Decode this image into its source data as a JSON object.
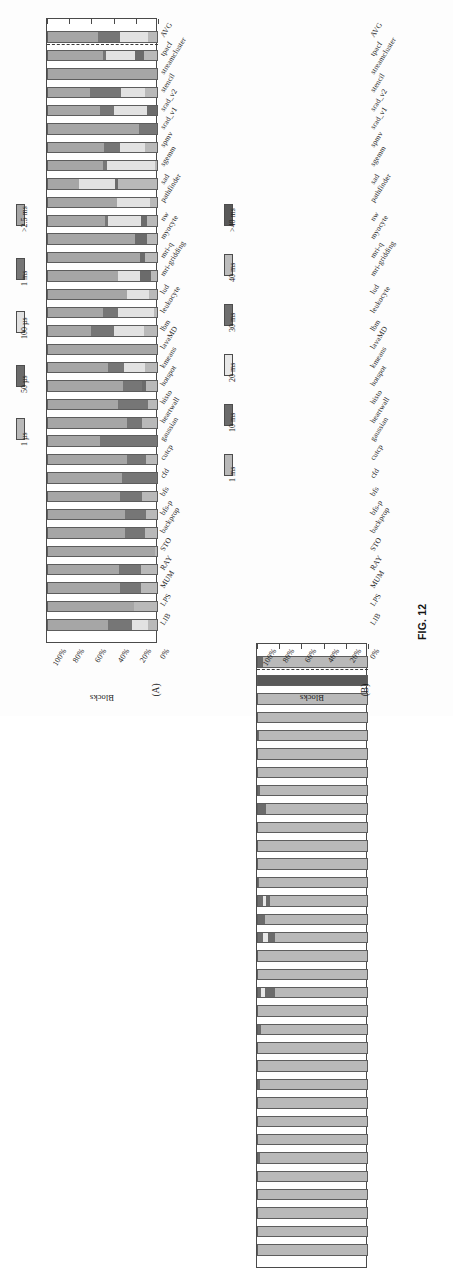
{
  "figure": {
    "caption": "FIG. 12",
    "panel_a_label": "(A)",
    "panel_b_label": "(B)"
  },
  "axis": {
    "y_title": "Blocks",
    "pct_ticks": [
      "100%",
      "80%",
      "60%",
      "40%",
      "20%",
      "0%"
    ]
  },
  "legend_a": {
    "items": [
      {
        "label": "1 µs",
        "color": "#b9b9b9"
      },
      {
        "label": "50 µs",
        "color": "#6b6b6b"
      },
      {
        "label": "100 µs",
        "color": "#e2e2e2"
      },
      {
        "label": "1 ms",
        "color": "#767676"
      },
      {
        "label": ">2.5 ms",
        "color": "#a6a6a6"
      }
    ]
  },
  "legend_b": {
    "items": [
      {
        "label": "1 ms",
        "color": "#b9b9b9"
      },
      {
        "label": "10 ms",
        "color": "#6b6b6b"
      },
      {
        "label": "20 ms",
        "color": "#e8e8e8"
      },
      {
        "label": "30 ms",
        "color": "#6f6f6f"
      },
      {
        "label": "40 ms",
        "color": "#bdbdbd"
      },
      {
        "label": ">40 ms",
        "color": "#595959"
      }
    ]
  },
  "chart_data": [
    {
      "type": "bar",
      "id": "panel-a",
      "title": "(A)",
      "orientation": "horizontal-stacked-100pct",
      "ylabel": "Blocks",
      "xlabel": "",
      "ylim": [
        0,
        100
      ],
      "grid": false,
      "legend_position": "left",
      "stacked_percent": true,
      "separator_after": "AVG",
      "categories": [
        "AVG",
        "tpacf",
        "streamcluster",
        "stencil",
        "srad_v2",
        "srad_v1",
        "spmv",
        "sgemm",
        "sad",
        "pathfinder",
        "nw",
        "myocyte",
        "mri-q",
        "mri-gridding",
        "lud",
        "leukocyte",
        "lbm",
        "lavaMD",
        "kmeans",
        "hotspot",
        "histo",
        "heartwall",
        "gaussian",
        "cutcp",
        "cfd",
        "bfs",
        "bfs-p",
        "backprop",
        "STO",
        "RAY",
        "MUM",
        "LPS",
        "LIB"
      ],
      "series": [
        {
          "name": "1 µs",
          "color": "#b9b9b9",
          "values": [
            9,
            13,
            0,
            12,
            0,
            0,
            12,
            3,
            36,
            7,
            10,
            10,
            12,
            6,
            8,
            4,
            13,
            0,
            12,
            11,
            9,
            14,
            0,
            11,
            0,
            14,
            11,
            12,
            3,
            15,
            15,
            22,
            9
          ]
        },
        {
          "name": "50 µs",
          "color": "#6b6b6b",
          "values": [
            0,
            8,
            0,
            0,
            10,
            0,
            0,
            0,
            3,
            0,
            5,
            11,
            4,
            10,
            0,
            0,
            0,
            0,
            0,
            3,
            0,
            0,
            0,
            0,
            0,
            0,
            0,
            0,
            0,
            0,
            0,
            0,
            0
          ]
        },
        {
          "name": "100 µs",
          "color": "#e2e2e2",
          "values": [
            25,
            26,
            0,
            21,
            30,
            0,
            22,
            43,
            32,
            30,
            30,
            0,
            0,
            20,
            20,
            32,
            27,
            0,
            19,
            0,
            0,
            0,
            0,
            0,
            0,
            0,
            0,
            0,
            0,
            0,
            0,
            0,
            14
          ]
        },
        {
          "name": "1 ms",
          "color": "#767676",
          "values": [
            20,
            3,
            0,
            28,
            12,
            17,
            15,
            4,
            0,
            0,
            3,
            0,
            0,
            0,
            0,
            14,
            20,
            0,
            14,
            18,
            27,
            14,
            52,
            17,
            32,
            20,
            19,
            18,
            0,
            20,
            19,
            0,
            22
          ]
        },
        {
          "name": ">2.5 ms",
          "color": "#a6a6a6",
          "values": [
            46,
            50,
            100,
            39,
            48,
            83,
            51,
            50,
            29,
            63,
            52,
            79,
            84,
            64,
            72,
            50,
            40,
            100,
            55,
            68,
            64,
            72,
            48,
            72,
            68,
            66,
            70,
            70,
            97,
            65,
            66,
            78,
            55
          ]
        }
      ],
      "note": "Values are percent of blocks in each kernel-duration bucket; each bar totals 100%."
    },
    {
      "type": "bar",
      "id": "panel-b",
      "title": "(B)",
      "orientation": "horizontal-stacked-100pct",
      "ylabel": "Blocks",
      "xlabel": "",
      "ylim": [
        0,
        100
      ],
      "grid": false,
      "legend_position": "left",
      "stacked_percent": true,
      "separator_after": "AVG",
      "categories": [
        "AVG",
        "tpacf",
        "streamcluster",
        "stencil",
        "srad_v2",
        "srad_v1",
        "spmv",
        "sgemm",
        "sad",
        "pathfinder",
        "nw",
        "myocyte",
        "mri-q",
        "mri-gridding",
        "lud",
        "leukocyte",
        "lbm",
        "lavaMD",
        "kmeans",
        "hotspot",
        "histo",
        "heartwall",
        "gaussian",
        "cutcp",
        "cfd",
        "bfs",
        "bfs-p",
        "backprop",
        "STO",
        "RAY",
        "MUM",
        "LPS",
        "LIB"
      ],
      "series": [
        {
          "name": "1 ms",
          "color": "#b9b9b9",
          "values": [
            95,
            0,
            100,
            100,
            98,
            100,
            100,
            97,
            92,
            99,
            100,
            100,
            98,
            88,
            93,
            84,
            100,
            100,
            84,
            100,
            96,
            100,
            100,
            97,
            100,
            100,
            100,
            97,
            100,
            100,
            100,
            100,
            100
          ]
        },
        {
          "name": "10 ms",
          "color": "#6b6b6b",
          "values": [
            5,
            0,
            0,
            0,
            2,
            0,
            0,
            3,
            8,
            1,
            0,
            0,
            2,
            4,
            7,
            6,
            0,
            0,
            9,
            0,
            4,
            0,
            0,
            3,
            0,
            0,
            0,
            3,
            0,
            0,
            0,
            0,
            0
          ]
        },
        {
          "name": "20 ms",
          "color": "#e8e8e8",
          "values": [
            0,
            0,
            0,
            0,
            0,
            0,
            0,
            0,
            0,
            0,
            0,
            0,
            0,
            3,
            0,
            5,
            0,
            0,
            3,
            0,
            0,
            0,
            0,
            0,
            0,
            0,
            0,
            0,
            0,
            0,
            0,
            0,
            0
          ]
        },
        {
          "name": "30 ms",
          "color": "#6f6f6f",
          "values": [
            0,
            0,
            0,
            0,
            0,
            0,
            0,
            0,
            0,
            0,
            0,
            0,
            0,
            5,
            0,
            5,
            0,
            0,
            4,
            0,
            0,
            0,
            0,
            0,
            0,
            0,
            0,
            0,
            0,
            0,
            0,
            0,
            0
          ]
        },
        {
          "name": "40 ms",
          "color": "#bdbdbd",
          "values": [
            0,
            0,
            0,
            0,
            0,
            0,
            0,
            0,
            0,
            0,
            0,
            0,
            0,
            0,
            0,
            0,
            0,
            0,
            0,
            0,
            0,
            0,
            0,
            0,
            0,
            0,
            0,
            0,
            0,
            0,
            0,
            0,
            0
          ]
        },
        {
          "name": ">40 ms",
          "color": "#595959",
          "values": [
            0,
            100,
            0,
            0,
            0,
            0,
            0,
            0,
            0,
            0,
            0,
            0,
            0,
            0,
            0,
            0,
            0,
            0,
            0,
            0,
            0,
            0,
            0,
            0,
            0,
            0,
            0,
            0,
            0,
            0,
            0,
            0,
            0
          ]
        }
      ],
      "note": "Values are percent of blocks in each kernel-duration bucket; each bar totals 100%."
    }
  ]
}
